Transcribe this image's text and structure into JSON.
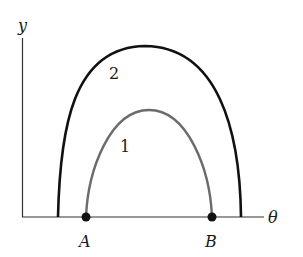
{
  "diagram": {
    "axes": {
      "y_label": "y",
      "x_label": "θ"
    },
    "curves": [
      {
        "id": "curve-1",
        "label": "1",
        "color": "#6b6b6b",
        "description": "inner arch from A to B"
      },
      {
        "id": "curve-2",
        "label": "2",
        "color": "#111111",
        "description": "outer arch, wider and taller"
      }
    ],
    "points": [
      {
        "id": "point-A",
        "label": "A"
      },
      {
        "id": "point-B",
        "label": "B"
      }
    ]
  }
}
